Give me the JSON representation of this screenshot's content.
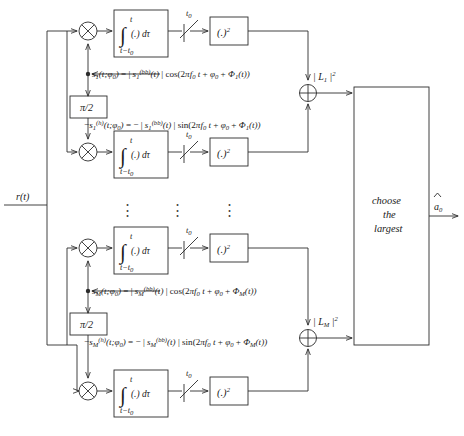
{
  "diagram": {
    "input_label": "r(t)",
    "output_label": "ä0",
    "output_label_base": "a",
    "output_label_sub": "0",
    "decision_block": {
      "line1": "choose",
      "line2": "the",
      "line3": "largest"
    },
    "phase_shifter_label": "π/2",
    "integrator": {
      "symbol": "∫",
      "upper_limit": "t",
      "lower_limit": "t−t0",
      "lower_limit_base": "t−t",
      "lower_limit_sub": "0",
      "body": "(.) dτ"
    },
    "sampler_label": "t0",
    "sampler_label_base": "t",
    "sampler_label_sub": "0",
    "square_block_label": "(.)2",
    "square_block_base": "(.)",
    "square_block_sup": "2",
    "multiplier_symbol": "⊗",
    "summer_symbol": "⊕",
    "ellipsis_symbol": "⋮",
    "branches": [
      {
        "index": "1",
        "cos_equation": "s1(t;φ0) = | s1(bb)(t) | cos(2πf0 t + φ0 + Φ1(t))",
        "sin_equation": "−s1(h)(t;φ0) = − | s1(bb)(t) | sin(2πf0 t + φ0 + Φ1(t))",
        "likelihood_label": "| L1 |2",
        "likelihood_base": "L",
        "likelihood_sub": "1",
        "likelihood_sup": "2"
      },
      {
        "index": "M",
        "cos_equation": "sM(t;φ0) = | sM(bb)(t) | cos(2πf0 t + φ0 + ΦM(t))",
        "sin_equation": "−sM(h)(t;φ0) = − | sM(bb)(t) | sin(2πf0 t + φ0 + ΦM(t))",
        "likelihood_label": "| LM |2",
        "likelihood_base": "L",
        "likelihood_sub": "M",
        "likelihood_sup": "2"
      }
    ],
    "colors": {
      "stroke": "#2c2c2c",
      "text": "#1a1a1a",
      "background": "#ffffff"
    }
  }
}
